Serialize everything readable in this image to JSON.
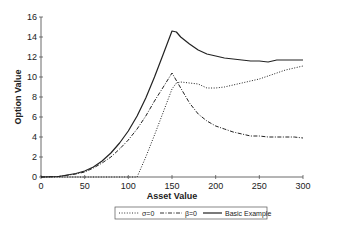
{
  "chart_data": {
    "type": "line",
    "title": "",
    "xlabel": "Asset Value",
    "ylabel": "Option Value",
    "xlim": [
      0,
      300
    ],
    "ylim": [
      0,
      16
    ],
    "x_ticks": [
      0,
      50,
      100,
      150,
      200,
      250,
      300
    ],
    "y_ticks": [
      0,
      2,
      4,
      6,
      8,
      10,
      12,
      14,
      16
    ],
    "grid": false,
    "legend_position": "bottom",
    "legend": [
      "σ=0",
      "β=0",
      "Basic Example"
    ],
    "series": [
      {
        "name": "σ=0",
        "style": "dotted",
        "x": [
          0,
          50,
          100,
          110,
          120,
          130,
          140,
          150,
          155,
          160,
          170,
          180,
          190,
          200,
          210,
          220,
          230,
          240,
          250,
          260,
          270,
          280,
          290,
          300
        ],
        "y": [
          0,
          0,
          0,
          0,
          2.0,
          4.2,
          6.5,
          8.8,
          9.4,
          9.5,
          9.4,
          9.3,
          8.9,
          8.9,
          9.0,
          9.2,
          9.4,
          9.6,
          9.8,
          10.1,
          10.4,
          10.7,
          10.9,
          11.1
        ]
      },
      {
        "name": "β=0",
        "style": "dash-dot",
        "x": [
          0,
          20,
          40,
          50,
          60,
          70,
          80,
          90,
          100,
          110,
          120,
          130,
          140,
          150,
          160,
          170,
          180,
          190,
          200,
          210,
          220,
          230,
          240,
          250,
          260,
          270,
          280,
          290,
          300
        ],
        "y": [
          0,
          0.05,
          0.3,
          0.5,
          0.9,
          1.4,
          2.0,
          2.8,
          3.7,
          4.8,
          6.1,
          7.6,
          9.0,
          10.4,
          8.9,
          7.4,
          6.3,
          5.6,
          5.1,
          4.8,
          4.5,
          4.3,
          4.1,
          4.1,
          4.0,
          4.0,
          4.0,
          4.0,
          3.9
        ]
      },
      {
        "name": "Basic Example",
        "style": "solid",
        "x": [
          0,
          20,
          40,
          50,
          60,
          70,
          80,
          90,
          100,
          110,
          120,
          130,
          140,
          150,
          155,
          160,
          170,
          180,
          190,
          200,
          210,
          220,
          230,
          240,
          250,
          260,
          270,
          280,
          290,
          300
        ],
        "y": [
          0,
          0.05,
          0.35,
          0.6,
          1.0,
          1.6,
          2.4,
          3.4,
          4.6,
          6.1,
          7.9,
          10.0,
          12.3,
          14.6,
          14.5,
          14.0,
          13.3,
          12.7,
          12.3,
          12.1,
          11.9,
          11.8,
          11.7,
          11.6,
          11.6,
          11.5,
          11.7,
          11.7,
          11.7,
          11.7
        ]
      }
    ]
  }
}
